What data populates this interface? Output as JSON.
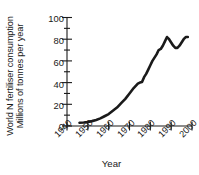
{
  "chart_data": {
    "type": "line",
    "title": "",
    "ylabel_lines": [
      "World N fertiliser consumption",
      "Millions of tonnes per year"
    ],
    "xlabel": "Year",
    "xlim": [
      1940,
      2000
    ],
    "ylim": [
      0,
      100
    ],
    "xticks": [
      1940,
      1950,
      1960,
      1970,
      1980,
      1990,
      2000
    ],
    "xtick_labels": [
      "1940",
      "1950",
      "1960",
      "1970",
      "1980",
      "1990",
      "2000"
    ],
    "yticks": [
      0,
      20,
      40,
      60,
      80,
      100
    ],
    "ytick_labels": [
      "0",
      "20",
      "40",
      "60",
      "80",
      "100"
    ],
    "y_minor_ticks": [
      10,
      30,
      50,
      70,
      90
    ],
    "grid": false,
    "legend": null,
    "line_color": "#1a1a1a",
    "line_width": 2.6,
    "series": [
      {
        "name": "World N fertiliser consumption",
        "x": [
          1946,
          1948,
          1950,
          1952,
          1954,
          1956,
          1958,
          1960,
          1962,
          1964,
          1966,
          1968,
          1970,
          1972,
          1974,
          1975,
          1976,
          1977,
          1978,
          1979,
          1980,
          1981,
          1982,
          1983,
          1984,
          1985,
          1986,
          1987,
          1988,
          1989,
          1990,
          1991,
          1992,
          1993,
          1994,
          1995,
          1996,
          1997,
          1998
        ],
        "y": [
          3,
          3.2,
          3.6,
          4.5,
          5.5,
          7,
          9,
          11,
          14,
          17,
          21,
          25,
          30,
          35,
          39,
          40,
          40.5,
          45,
          48,
          52,
          56,
          60,
          63,
          66,
          70,
          71,
          74,
          78,
          82,
          80,
          77,
          74,
          72,
          72,
          74,
          77,
          80,
          82,
          82
        ]
      }
    ]
  },
  "axes": {
    "y_axis_label_name": "y-axis-title",
    "x_axis_label_name": "x-axis-title"
  }
}
